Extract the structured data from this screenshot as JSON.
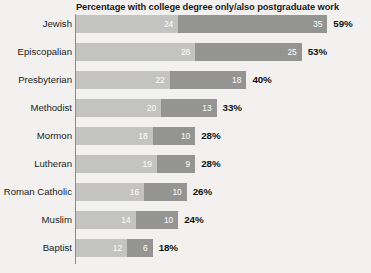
{
  "chart_data": {
    "type": "bar",
    "subtype": "horizontal-stacked",
    "title": "Percentage with college degree only/also postgraduate work",
    "xlabel": "",
    "ylabel": "",
    "grid": false,
    "legend_position": "none",
    "xlim": [
      0,
      62
    ],
    "categories": [
      "Jewish",
      "Episcopalian",
      "Presbyterian",
      "Methodist",
      "Mormon",
      "Lutheran",
      "Roman Catholic",
      "Muslim",
      "Baptist"
    ],
    "series": [
      {
        "name": "College degree only",
        "color": "#c3c3c1",
        "values": [
          24,
          28,
          22,
          20,
          18,
          19,
          16,
          14,
          12
        ]
      },
      {
        "name": "Also postgraduate work",
        "color": "#949492",
        "values": [
          35,
          25,
          18,
          13,
          10,
          9,
          10,
          10,
          6
        ]
      }
    ],
    "totals": [
      59,
      53,
      40,
      33,
      28,
      28,
      26,
      24,
      18
    ],
    "total_labels": [
      "59%",
      "53%",
      "40%",
      "33%",
      "28%",
      "28%",
      "26%",
      "24%",
      "18%"
    ],
    "rows": [
      {
        "label": "Jewish",
        "a": 24,
        "b": 35,
        "total_label": "59%"
      },
      {
        "label": "Episcopalian",
        "a": 28,
        "b": 25,
        "total_label": "53%"
      },
      {
        "label": "Presbyterian",
        "a": 22,
        "b": 18,
        "total_label": "40%"
      },
      {
        "label": "Methodist",
        "a": 20,
        "b": 13,
        "total_label": "33%"
      },
      {
        "label": "Mormon",
        "a": 18,
        "b": 10,
        "total_label": "28%"
      },
      {
        "label": "Lutheran",
        "a": 19,
        "b": 9,
        "total_label": "28%"
      },
      {
        "label": "Roman Catholic",
        "a": 16,
        "b": 10,
        "total_label": "26%"
      },
      {
        "label": "Muslim",
        "a": 14,
        "b": 10,
        "total_label": "24%"
      },
      {
        "label": "Baptist",
        "a": 12,
        "b": 6,
        "total_label": "18%"
      }
    ]
  },
  "colors": {
    "background": "#f2f1ef",
    "segment_light": "#c3c3c1",
    "segment_dark": "#949492",
    "axis": "#8e8d8b",
    "text": "#1d1d1d",
    "value_text": "#ffffff"
  }
}
